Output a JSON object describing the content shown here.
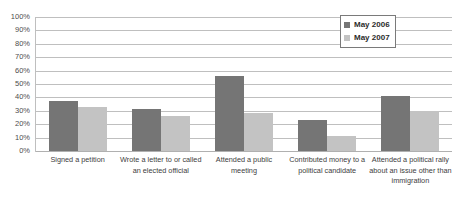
{
  "title_remnant": "",
  "legend": {
    "position": "top-right-inside",
    "entries": [
      {
        "label": "May 2006",
        "color": "#757575"
      },
      {
        "label": "May 2007",
        "color": "#c3c3c3"
      }
    ]
  },
  "axis": {
    "y_ticks": [
      "100%",
      "90%",
      "80%",
      "70%",
      "60%",
      "50%",
      "40%",
      "30%",
      "20%",
      "10%",
      "0%"
    ]
  },
  "chart_data": {
    "type": "bar",
    "title": "",
    "subtitle": "",
    "xlabel": "",
    "ylabel": "",
    "ylim": [
      0,
      100
    ],
    "ytick_step": 10,
    "ytick_format": "percent",
    "grid": true,
    "legend_position": "top right",
    "categories": [
      "Signed a petition",
      "Wrote a letter to or called an elected official",
      "Attended a public meeting",
      "Contributed money to a political candidate",
      "Attended a political rally about an issue other than immigration"
    ],
    "series": [
      {
        "name": "May 2006",
        "color": "#757575",
        "values": [
          37,
          31,
          56,
          23,
          41
        ]
      },
      {
        "name": "May 2007",
        "color": "#c3c3c3",
        "values": [
          33,
          26,
          28,
          11,
          30
        ]
      }
    ]
  }
}
